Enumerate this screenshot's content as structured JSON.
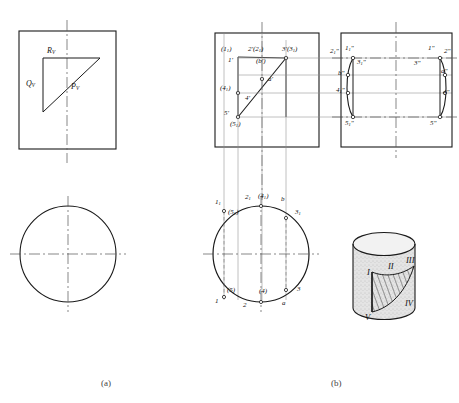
{
  "figure": {
    "captions": [
      {
        "id": "cap-a",
        "text": "(a)"
      },
      {
        "id": "cap-b",
        "text": "(b)"
      }
    ]
  },
  "panel_a": {
    "name": "trace-of-cutting-plane",
    "labels": [
      {
        "id": "Rv",
        "text": "R",
        "sub": "V"
      },
      {
        "id": "Qv",
        "text": "Q",
        "sub": "V"
      },
      {
        "id": "Pv",
        "text": "P",
        "sub": "V"
      }
    ]
  },
  "panel_b": {
    "front_view": {
      "name": "front-view-left-box",
      "labels": [
        {
          "id": "p1-sub1-paren",
          "text": "(1",
          "sub": "1",
          "tail": ")"
        },
        {
          "id": "p2prime",
          "text": "2'(2",
          "sub": "1",
          "tail": ")"
        },
        {
          "id": "p3prime",
          "text": "3'(3",
          "sub": "1",
          "tail": ")"
        },
        {
          "id": "p1prime",
          "text": "1'"
        },
        {
          "id": "pbprime",
          "text": "(b')"
        },
        {
          "id": "paprime",
          "text": "a'"
        },
        {
          "id": "p4-sub1",
          "text": "(4",
          "sub": "1",
          "tail": ")"
        },
        {
          "id": "p4prime",
          "text": "4'"
        },
        {
          "id": "p5prime",
          "text": "5'"
        },
        {
          "id": "p5-sub1",
          "text": "(5",
          "sub": "1",
          "tail": ")"
        }
      ]
    },
    "side_view": {
      "name": "side-view-right-box",
      "labels": [
        {
          "id": "s2-sub1",
          "text": "2",
          "sub": "1",
          "tail": "\""
        },
        {
          "id": "s1-sub1",
          "text": "1",
          "sub": "1",
          "tail": "\""
        },
        {
          "id": "s3-sub1",
          "text": "3",
          "sub": "1",
          "tail": "\""
        },
        {
          "id": "sbpp",
          "text": "b\""
        },
        {
          "id": "s4-sub1",
          "text": "4",
          "sub": "1",
          "tail": "\""
        },
        {
          "id": "s5-sub1",
          "text": "5",
          "sub": "1",
          "tail": "\""
        },
        {
          "id": "s1pp",
          "text": "1\""
        },
        {
          "id": "s2pp",
          "text": "2\""
        },
        {
          "id": "s3pp",
          "text": "3\""
        },
        {
          "id": "sapp",
          "text": "a\""
        },
        {
          "id": "s4pp",
          "text": "4\""
        },
        {
          "id": "s5pp",
          "text": "5\""
        }
      ]
    },
    "top_view": {
      "name": "top-view-circle",
      "labels": [
        {
          "id": "t1-sub1",
          "text": "1",
          "sub": "1"
        },
        {
          "id": "t2-sub1",
          "text": "2",
          "sub": "1"
        },
        {
          "id": "t4-sub1",
          "text": "(4",
          "sub": "1",
          "tail": ")"
        },
        {
          "id": "tb",
          "text": "b"
        },
        {
          "id": "t3-sub1",
          "text": "3",
          "sub": "1"
        },
        {
          "id": "t5-sub1",
          "text": "(5",
          "sub": "1",
          "tail": ")"
        },
        {
          "id": "t1",
          "text": "1"
        },
        {
          "id": "t5",
          "text": "(5)"
        },
        {
          "id": "t2",
          "text": "2"
        },
        {
          "id": "t4",
          "text": "(4)"
        },
        {
          "id": "ta",
          "text": "a"
        },
        {
          "id": "t3",
          "text": "3"
        }
      ]
    },
    "pictorial": {
      "name": "cylinder-pictorial",
      "labels": [
        {
          "id": "rn-I",
          "text": "I"
        },
        {
          "id": "rn-II",
          "text": "II"
        },
        {
          "id": "rn-III",
          "text": "III"
        },
        {
          "id": "rn-IV",
          "text": "IV"
        },
        {
          "id": "rn-V",
          "text": "V"
        }
      ]
    }
  },
  "colors": {
    "ink": "#1a1a1a",
    "thin": "#777777",
    "center": "#555555",
    "paper": "#ffffff",
    "shade": "#cfcfcf"
  }
}
